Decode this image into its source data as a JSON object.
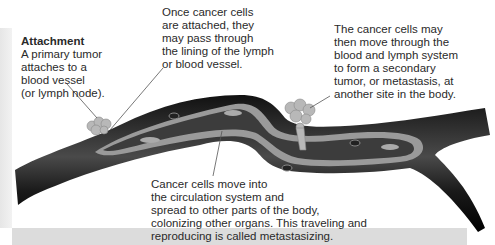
{
  "diagram": {
    "type": "metastasis illustration",
    "colors": {
      "vessel_wall": "#1a1a1a",
      "vessel_lining": "#9a9a9a",
      "lumen": "#3c3c3c",
      "tumor": "#b5b5b5",
      "background_band": "#dcdcdc"
    },
    "labels": {
      "attachment": {
        "title": "Attachment",
        "text": "A primary tumor\nattaches to a\nblood vessel\n(or lymph node)."
      },
      "pass_through": {
        "text": "Once cancer cells\nare attached, they\nmay pass through\nthe lining of the lymph\nor blood vessel."
      },
      "secondary_tumor": {
        "text": "The cancer cells may\nthen move through the\nblood and lymph system\nto form a secondary\ntumor, or metastasis, at\nanother site in the body."
      },
      "circulation": {
        "text": "Cancer cells move into\nthe circulation system and\nspread to other parts of the body,\ncolonizing other organs. This traveling and\nreproducing is called metastasizing."
      }
    }
  }
}
